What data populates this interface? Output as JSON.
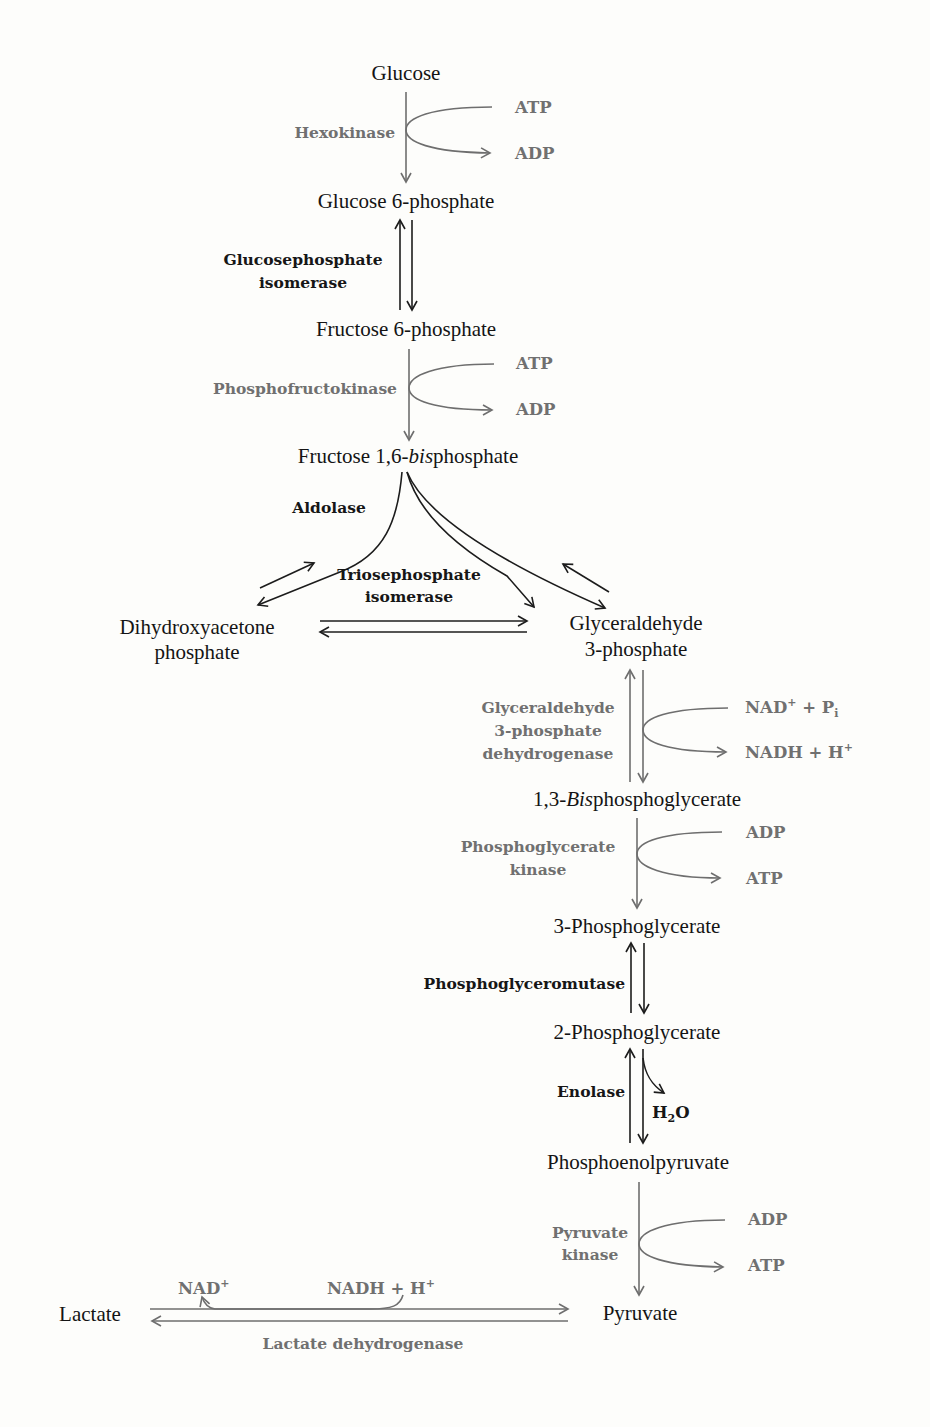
{
  "colors": {
    "background": "#fdfdfb",
    "metabolite_text": "#141414",
    "gray_enzyme": "#707070",
    "black_enzyme": "#161616"
  },
  "metabolites": {
    "glucose": "Glucose",
    "glucose_6_phosphate": "Glucose 6-phosphate",
    "fructose_6_phosphate": "Fructose 6-phosphate",
    "fructose_16_bisphosphate": {
      "prefix": "Fructose 1,6-",
      "italic": "bis",
      "suffix": "phosphate"
    },
    "dhap_line1": "Dihydroxyacetone",
    "dhap_line2": "phosphate",
    "g3p_line1": "Glyceraldehyde",
    "g3p_line2": "3-phosphate",
    "bpg13": {
      "prefix": "1,3-",
      "italic": "Bis",
      "suffix": "phosphoglycerate"
    },
    "pg3": "3-Phosphoglycerate",
    "pg2": "2-Phosphoglycerate",
    "pep": "Phosphoenolpyruvate",
    "pyruvate": "Pyruvate",
    "lactate": "Lactate"
  },
  "steps": [
    {
      "enzyme": [
        "Hexokinase"
      ],
      "enzyme_style": "gray",
      "reversible": false,
      "cofactor_in": "ATP",
      "cofactor_out": "ADP"
    },
    {
      "enzyme": [
        "Glucosephosphate",
        "isomerase"
      ],
      "enzyme_style": "black",
      "reversible": true
    },
    {
      "enzyme": [
        "Phosphofructokinase"
      ],
      "enzyme_style": "gray",
      "reversible": false,
      "cofactor_in": "ATP",
      "cofactor_out": "ADP"
    },
    {
      "enzyme": [
        "Aldolase"
      ],
      "enzyme_style": "black",
      "reversible": true
    },
    {
      "enzyme": [
        "Triosephosphate",
        "isomerase"
      ],
      "enzyme_style": "black",
      "reversible": true
    },
    {
      "enzyme": [
        "Glyceraldehyde",
        "3-phosphate",
        "dehydrogenase"
      ],
      "enzyme_style": "gray",
      "reversible": true,
      "cofactor_in": {
        "base": "NAD",
        "sup": "+",
        "mid": " + P",
        "sub": "i"
      },
      "cofactor_out": {
        "base": "NADH + H",
        "sup": "+"
      }
    },
    {
      "enzyme": [
        "Phosphoglycerate",
        "kinase"
      ],
      "enzyme_style": "gray",
      "reversible": false,
      "cofactor_in": "ADP",
      "cofactor_out": "ATP"
    },
    {
      "enzyme": [
        "Phosphoglyceromutase"
      ],
      "enzyme_style": "black",
      "reversible": true
    },
    {
      "enzyme": [
        "Enolase"
      ],
      "enzyme_style": "black",
      "reversible": true,
      "cofactor_out": {
        "base": "H",
        "sub": "2",
        "suffix": "O"
      }
    },
    {
      "enzyme": [
        "Pyruvate",
        "kinase"
      ],
      "enzyme_style": "gray",
      "reversible": false,
      "cofactor_in": "ADP",
      "cofactor_out": "ATP"
    },
    {
      "enzyme": [
        "Lactate dehydrogenase"
      ],
      "enzyme_style": "gray",
      "reversible": true,
      "cofactor_in": {
        "base": "NADH + H",
        "sup": "+"
      },
      "cofactor_out": {
        "base": "NAD",
        "sup": "+"
      }
    }
  ]
}
